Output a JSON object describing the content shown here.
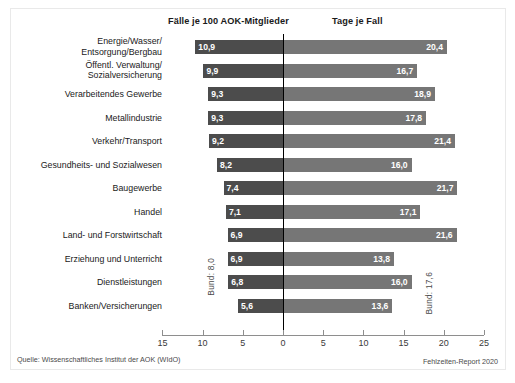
{
  "headers": {
    "left": "Fälle je 100 AOK-Mitglieder",
    "right": "Tage je Fall"
  },
  "annotations": {
    "bund_left": "Bund: 8,0",
    "bund_right": "Bund: 17,6"
  },
  "footer": {
    "source": "Quelle: Wissenschaftliches Institut der AOK (WIdO)",
    "report": "Fehlzeiten-Report 2020"
  },
  "axis": {
    "tick_labels": [
      "15",
      "10",
      "5",
      "0",
      "5",
      "10",
      "15",
      "20",
      "25"
    ],
    "tick_values": [
      -15,
      -10,
      -5,
      0,
      5,
      10,
      15,
      20,
      25
    ],
    "min": -15,
    "max": 25
  },
  "chart_data": {
    "type": "bar",
    "title": "",
    "subtitle": "",
    "orientation": "horizontal",
    "layout": "diverging-bidirectional",
    "grid": false,
    "legend": "none",
    "xlabel": "",
    "ylabel": "",
    "xlim": [
      -15,
      25
    ],
    "categories": [
      "Energie/Wasser/\nEntsorgung/Bergbau",
      "Öffentl. Verwaltung/\nSozialversicherung",
      "Verarbeitendes Gewerbe",
      "Metallindustrie",
      "Verkehr/Transport",
      "Gesundheits- und Sozialwesen",
      "Baugewerbe",
      "Handel",
      "Land- und Forstwirtschaft",
      "Erziehung und Unterricht",
      "Dienstleistungen",
      "Banken/Versicherungen"
    ],
    "series": [
      {
        "name": "Fälle je 100 AOK-Mitglieder",
        "direction": "left",
        "color": "#4c4c4c",
        "values": [
          10.9,
          9.9,
          9.3,
          9.3,
          9.2,
          8.2,
          7.4,
          7.1,
          6.9,
          6.9,
          6.8,
          5.6
        ],
        "labels": [
          "10,9",
          "9,9",
          "9,3",
          "9,3",
          "9,2",
          "8,2",
          "7,4",
          "7,1",
          "6,9",
          "6,9",
          "6,8",
          "5,6"
        ],
        "reference_line": {
          "label": "Bund: 8,0",
          "value": 8.0
        }
      },
      {
        "name": "Tage je Fall",
        "direction": "right",
        "color": "#767676",
        "values": [
          20.4,
          16.7,
          18.9,
          17.8,
          21.4,
          16.0,
          21.7,
          17.1,
          21.6,
          13.8,
          16.0,
          13.6
        ],
        "labels": [
          "20,4",
          "16,7",
          "18,9",
          "17,8",
          "21,4",
          "16,0",
          "21,7",
          "17,1",
          "21,6",
          "13,8",
          "16,0",
          "13,6"
        ],
        "reference_line": {
          "label": "Bund: 17,6",
          "value": 17.6
        }
      }
    ]
  }
}
